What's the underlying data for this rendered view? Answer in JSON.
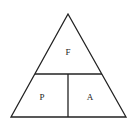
{
  "diagram": {
    "type": "formula-triangle",
    "labels": {
      "top": "F",
      "bottom_left": "P",
      "bottom_right": "A"
    },
    "line_color": "#222222"
  }
}
